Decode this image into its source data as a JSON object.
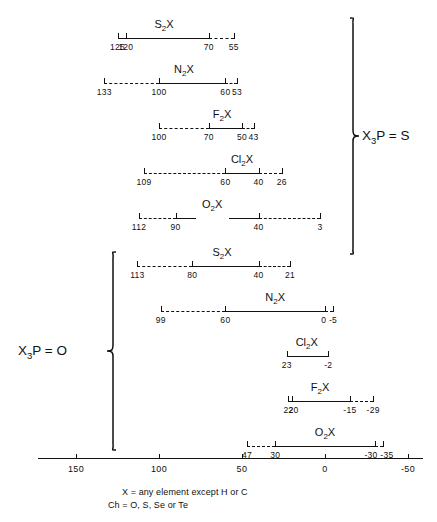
{
  "figure": {
    "axis": {
      "label_values": [
        "150",
        "100",
        "50",
        "0",
        "-50"
      ],
      "ticks": [
        150,
        100,
        50,
        0,
        -50
      ],
      "min": -50,
      "max": 160,
      "color": "#111111"
    },
    "groups": [
      {
        "id": "x3p-s",
        "label": "X3P = S",
        "label_html": "X<sub>3</sub>P = S",
        "brace_side": "right",
        "rows": [
          {
            "label_html": "S<sub>2</sub>X",
            "label_text": "S2X",
            "label_center": 97,
            "segments": [
              {
                "from": 125,
                "to": 120,
                "style": "solid"
              },
              {
                "from": 120,
                "to": 70,
                "style": "solid"
              },
              {
                "from": 70,
                "to": 55,
                "style": "dashed"
              }
            ],
            "caps": [
              125,
              120,
              70,
              55
            ],
            "tick_values": [
              {
                "value": 125,
                "text": "125"
              },
              {
                "value": 120,
                "text": "120"
              },
              {
                "value": 70,
                "text": "70"
              },
              {
                "value": 55,
                "text": "55"
              }
            ]
          },
          {
            "label_html": "N<sub>2</sub>X",
            "label_text": "N2X",
            "label_center": 85,
            "segments": [
              {
                "from": 133,
                "to": 100,
                "style": "dashed"
              },
              {
                "from": 100,
                "to": 60,
                "style": "solid"
              },
              {
                "from": 60,
                "to": 53,
                "style": "dashed"
              }
            ],
            "caps": [
              133,
              100,
              60,
              53
            ],
            "tick_values": [
              {
                "value": 133,
                "text": "133"
              },
              {
                "value": 100,
                "text": "100"
              },
              {
                "value": 60,
                "text": "60"
              },
              {
                "value": 53,
                "text": "53"
              }
            ]
          },
          {
            "label_html": "F<sub>2</sub>X",
            "label_text": "F2X",
            "label_center": 62,
            "segments": [
              {
                "from": 100,
                "to": 70,
                "style": "dashed"
              },
              {
                "from": 70,
                "to": 50,
                "style": "solid"
              },
              {
                "from": 50,
                "to": 43,
                "style": "dashed"
              }
            ],
            "caps": [
              100,
              70,
              50,
              43
            ],
            "tick_values": [
              {
                "value": 100,
                "text": "100"
              },
              {
                "value": 70,
                "text": "70"
              },
              {
                "value": 50,
                "text": "50"
              },
              {
                "value": 43,
                "text": "43"
              }
            ]
          },
          {
            "label_html": "Cl<sub>2</sub>X",
            "label_text": "Cl2X",
            "label_center": 50,
            "segments": [
              {
                "from": 109,
                "to": 60,
                "style": "dashed"
              },
              {
                "from": 60,
                "to": 40,
                "style": "solid"
              },
              {
                "from": 40,
                "to": 26,
                "style": "dashed"
              }
            ],
            "caps": [
              109,
              60,
              40,
              26
            ],
            "tick_values": [
              {
                "value": 109,
                "text": "109"
              },
              {
                "value": 60,
                "text": "60"
              },
              {
                "value": 40,
                "text": "40"
              },
              {
                "value": 26,
                "text": "26"
              }
            ]
          },
          {
            "label_html": "O<sub>2</sub>X",
            "label_text": "O2X",
            "label_center": 68,
            "segments": [
              {
                "from": 112,
                "to": 90,
                "style": "dashed"
              },
              {
                "from": 90,
                "to": 78,
                "style": "solid"
              },
              {
                "from": 58,
                "to": 40,
                "style": "solid"
              },
              {
                "from": 40,
                "to": 3,
                "style": "dashed"
              }
            ],
            "caps": [
              112,
              90,
              40,
              3
            ],
            "tick_values": [
              {
                "value": 112,
                "text": "112"
              },
              {
                "value": 90,
                "text": "90"
              },
              {
                "value": 40,
                "text": "40"
              },
              {
                "value": 3,
                "text": "3"
              }
            ]
          }
        ]
      },
      {
        "id": "x3p-o",
        "label": "X3P = O",
        "label_html": "X<sub>3</sub>P = O",
        "brace_side": "left",
        "rows": [
          {
            "label_html": "S<sub>2</sub>X",
            "label_text": "S2X",
            "label_center": 62,
            "segments": [
              {
                "from": 113,
                "to": 80,
                "style": "dashed"
              },
              {
                "from": 80,
                "to": 40,
                "style": "solid"
              },
              {
                "from": 40,
                "to": 21,
                "style": "dashed"
              }
            ],
            "caps": [
              113,
              80,
              40,
              21
            ],
            "tick_values": [
              {
                "value": 113,
                "text": "113"
              },
              {
                "value": 80,
                "text": "80"
              },
              {
                "value": 40,
                "text": "40"
              },
              {
                "value": 21,
                "text": "21"
              }
            ]
          },
          {
            "label_html": "N<sub>2</sub>X",
            "label_text": "N2X",
            "label_center": 30,
            "segments": [
              {
                "from": 99,
                "to": 60,
                "style": "dashed"
              },
              {
                "from": 60,
                "to": 0,
                "style": "solid"
              },
              {
                "from": 0,
                "to": -5,
                "style": "dashed"
              }
            ],
            "caps": [
              99,
              60,
              0,
              -5
            ],
            "tick_values": [
              {
                "value": 99,
                "text": "99"
              },
              {
                "value": 60,
                "text": "60"
              },
              {
                "value": -2.5,
                "text": "0 -5"
              }
            ]
          },
          {
            "label_html": "Cl<sub>2</sub>X",
            "label_text": "Cl2X",
            "label_center": 11,
            "segments": [
              {
                "from": 23,
                "to": -2,
                "style": "solid"
              }
            ],
            "caps": [
              23,
              -2
            ],
            "tick_values": [
              {
                "value": 23,
                "text": "23"
              },
              {
                "value": -2,
                "text": "-2"
              }
            ]
          },
          {
            "label_html": "F<sub>2</sub>X",
            "label_text": "F2X",
            "label_center": 3,
            "segments": [
              {
                "from": 22,
                "to": 20,
                "style": "solid"
              },
              {
                "from": 20,
                "to": -15,
                "style": "solid"
              },
              {
                "from": -15,
                "to": -29,
                "style": "dashed"
              }
            ],
            "caps": [
              22,
              20,
              -15,
              -29
            ],
            "tick_values": [
              {
                "value": 22,
                "text": "22"
              },
              {
                "value": 19,
                "text": "20"
              },
              {
                "value": -15,
                "text": "-15"
              },
              {
                "value": -29,
                "text": "-29"
              }
            ]
          },
          {
            "label_html": "O<sub>2</sub>X",
            "label_text": "O2X",
            "label_center": 0,
            "segments": [
              {
                "from": 47,
                "to": 30,
                "style": "dashed"
              },
              {
                "from": 30,
                "to": -30,
                "style": "solid"
              },
              {
                "from": -30,
                "to": -35,
                "style": "dashed"
              }
            ],
            "caps": [
              47,
              30,
              -30,
              -35
            ],
            "tick_values": [
              {
                "value": 47,
                "text": "47"
              },
              {
                "value": 30,
                "text": "30"
              },
              {
                "value": -32.5,
                "text": "-30 -35"
              }
            ]
          }
        ]
      }
    ],
    "caption": {
      "line1": "X = any element except H or C",
      "line2": "Ch = O, S, Se or Te"
    }
  },
  "chart_data": {
    "type": "bar",
    "title": "",
    "xlabel": "",
    "ylabel": "",
    "xlim": [
      160,
      -50
    ],
    "grid": false,
    "legend": "none",
    "axis_ticks": [
      150,
      100,
      50,
      0,
      -50
    ],
    "series": [
      {
        "group": "X3P = S",
        "name": "S2X",
        "solid_range": [
          120,
          70
        ],
        "dashed_ranges": [
          [
            125,
            120
          ],
          [
            70,
            55
          ]
        ],
        "labels": [
          "125",
          "120",
          "70",
          "55"
        ]
      },
      {
        "group": "X3P = S",
        "name": "N2X",
        "solid_range": [
          100,
          60
        ],
        "dashed_ranges": [
          [
            133,
            100
          ],
          [
            60,
            53
          ]
        ],
        "labels": [
          "133",
          "100",
          "60",
          "53"
        ]
      },
      {
        "group": "X3P = S",
        "name": "F2X",
        "solid_range": [
          70,
          50
        ],
        "dashed_ranges": [
          [
            100,
            70
          ],
          [
            50,
            43
          ]
        ],
        "labels": [
          "100",
          "70",
          "50",
          "43"
        ]
      },
      {
        "group": "X3P = S",
        "name": "Cl2X",
        "solid_range": [
          60,
          40
        ],
        "dashed_ranges": [
          [
            109,
            60
          ],
          [
            40,
            26
          ]
        ],
        "labels": [
          "109",
          "60",
          "40",
          "26"
        ]
      },
      {
        "group": "X3P = S",
        "name": "O2X",
        "solid_range": [
          90,
          40
        ],
        "dashed_ranges": [
          [
            112,
            90
          ],
          [
            40,
            3
          ]
        ],
        "labels": [
          "112",
          "90",
          "40",
          "3"
        ]
      },
      {
        "group": "X3P = O",
        "name": "S2X",
        "solid_range": [
          80,
          40
        ],
        "dashed_ranges": [
          [
            113,
            80
          ],
          [
            40,
            21
          ]
        ],
        "labels": [
          "113",
          "80",
          "40",
          "21"
        ]
      },
      {
        "group": "X3P = O",
        "name": "N2X",
        "solid_range": [
          60,
          0
        ],
        "dashed_ranges": [
          [
            99,
            60
          ],
          [
            0,
            -5
          ]
        ],
        "labels": [
          "99",
          "60",
          "0",
          "-5"
        ]
      },
      {
        "group": "X3P = O",
        "name": "Cl2X",
        "solid_range": [
          23,
          -2
        ],
        "dashed_ranges": [],
        "labels": [
          "23",
          "-2"
        ]
      },
      {
        "group": "X3P = O",
        "name": "F2X",
        "solid_range": [
          20,
          -15
        ],
        "dashed_ranges": [
          [
            -15,
            -29
          ]
        ],
        "labels": [
          "22",
          "20",
          "-15",
          "-29"
        ]
      },
      {
        "group": "X3P = O",
        "name": "O2X",
        "solid_range": [
          30,
          -30
        ],
        "dashed_ranges": [
          [
            47,
            30
          ],
          [
            -30,
            -35
          ]
        ],
        "labels": [
          "47",
          "30",
          "-30",
          "-35"
        ]
      }
    ]
  }
}
